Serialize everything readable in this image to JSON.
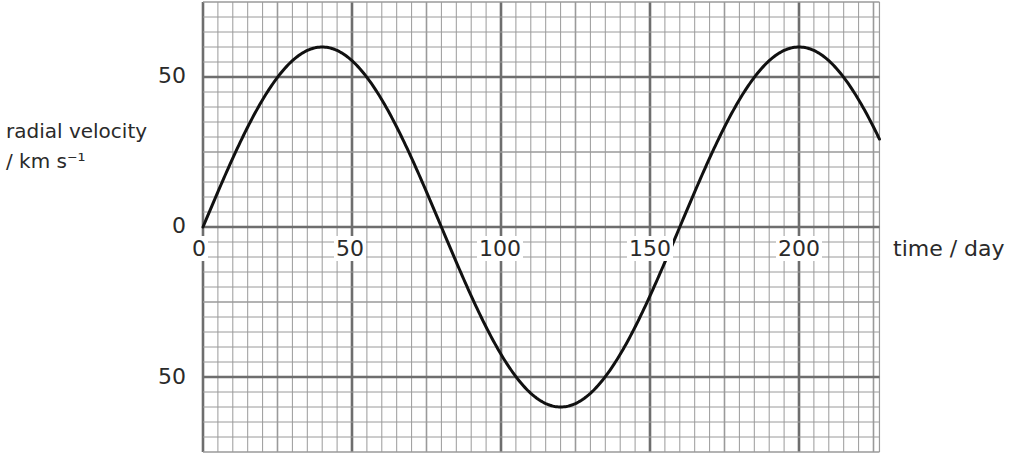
{
  "chart_data": {
    "type": "line",
    "title": "",
    "xlabel": "time / day",
    "ylabel": "radial velocity / km s⁻¹",
    "ylabel_line1": "radial velocity",
    "ylabel_line2": "/ km s⁻¹",
    "xlim": [
      0,
      227
    ],
    "ylim": [
      -75,
      75
    ],
    "x_ticks": [
      0,
      50,
      100,
      150,
      200
    ],
    "x_tick_labels": [
      "0",
      "50",
      "100",
      "150",
      "200"
    ],
    "y_ticks": [
      50,
      0,
      -50
    ],
    "y_tick_labels": [
      "50",
      "0",
      "50"
    ],
    "grid": true,
    "grid_minor_step_x": 5,
    "grid_minor_step_y": 5,
    "grid_major_step": 50,
    "series": [
      {
        "name": "radial velocity",
        "function": "60*sin(2*pi*t/160)",
        "amplitude": 60,
        "period": 160,
        "x": [
          0,
          10,
          20,
          30,
          40,
          50,
          60,
          70,
          80,
          90,
          100,
          110,
          120,
          130,
          140,
          150,
          160,
          170,
          180,
          190,
          200,
          210,
          220,
          227
        ],
        "values": [
          0,
          23,
          42.4,
          55.4,
          60,
          55.4,
          42.4,
          23,
          0,
          -23,
          -42.4,
          -55.4,
          -60,
          -55.4,
          -42.4,
          -23,
          0,
          23,
          42.4,
          55.4,
          60,
          55.4,
          42.4,
          33.8
        ]
      }
    ],
    "annotations": []
  },
  "labels": {
    "y_top": "50",
    "y_zero": "0",
    "y_bottom": "50",
    "x0": "0",
    "x50": "50",
    "x100": "100",
    "x150": "150",
    "x200": "200"
  },
  "colors": {
    "curve": "#111111",
    "grid_minor": "#9a9a9a",
    "grid_major": "#6e6e6e",
    "text": "#2a2a2a"
  }
}
